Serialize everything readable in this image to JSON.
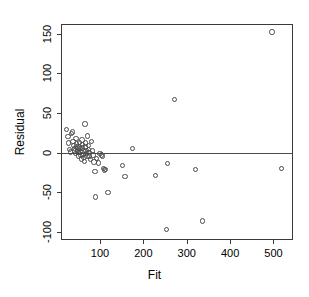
{
  "chart_data": {
    "type": "scatter",
    "title": "",
    "xlabel": "Fit",
    "ylabel": "Residual",
    "xlim": [
      10,
      545
    ],
    "ylim": [
      -110,
      162
    ],
    "xticks": [
      100,
      200,
      300,
      400,
      500
    ],
    "xtick_labels": [
      "100",
      "200",
      "300",
      "400",
      "500"
    ],
    "yticks": [
      -100,
      -50,
      0,
      50,
      100,
      150
    ],
    "ytick_labels": [
      "-100",
      "-50",
      "0",
      "50",
      "100",
      "150"
    ],
    "grid": false,
    "legend": null,
    "marker": "open-circle",
    "reference_lines": [
      {
        "orientation": "horizontal",
        "y": 0
      }
    ],
    "points": [
      {
        "x": 22,
        "y": 29
      },
      {
        "x": 26,
        "y": 20
      },
      {
        "x": 28,
        "y": 12
      },
      {
        "x": 30,
        "y": 4
      },
      {
        "x": 32,
        "y": 1
      },
      {
        "x": 34,
        "y": 24
      },
      {
        "x": 36,
        "y": 26
      },
      {
        "x": 38,
        "y": 14
      },
      {
        "x": 40,
        "y": 9
      },
      {
        "x": 41,
        "y": 5
      },
      {
        "x": 42,
        "y": 2
      },
      {
        "x": 43,
        "y": -1
      },
      {
        "x": 45,
        "y": 18
      },
      {
        "x": 46,
        "y": 11
      },
      {
        "x": 47,
        "y": 7
      },
      {
        "x": 48,
        "y": 3
      },
      {
        "x": 49,
        "y": 0
      },
      {
        "x": 50,
        "y": -4
      },
      {
        "x": 52,
        "y": 13
      },
      {
        "x": 53,
        "y": 8
      },
      {
        "x": 54,
        "y": 5
      },
      {
        "x": 55,
        "y": 1
      },
      {
        "x": 56,
        "y": -3
      },
      {
        "x": 57,
        "y": -8
      },
      {
        "x": 58,
        "y": 16
      },
      {
        "x": 59,
        "y": 10
      },
      {
        "x": 60,
        "y": 6
      },
      {
        "x": 61,
        "y": 2
      },
      {
        "x": 62,
        "y": -2
      },
      {
        "x": 63,
        "y": -6
      },
      {
        "x": 64,
        "y": -11
      },
      {
        "x": 65,
        "y": 36
      },
      {
        "x": 66,
        "y": 12
      },
      {
        "x": 67,
        "y": 7
      },
      {
        "x": 68,
        "y": 3
      },
      {
        "x": 69,
        "y": -1
      },
      {
        "x": 70,
        "y": -5
      },
      {
        "x": 71,
        "y": 21
      },
      {
        "x": 73,
        "y": 9
      },
      {
        "x": 74,
        "y": 4
      },
      {
        "x": 75,
        "y": 0
      },
      {
        "x": 76,
        "y": -4
      },
      {
        "x": 78,
        "y": -9
      },
      {
        "x": 80,
        "y": 14
      },
      {
        "x": 82,
        "y": 2
      },
      {
        "x": 84,
        "y": -3
      },
      {
        "x": 86,
        "y": -12
      },
      {
        "x": 88,
        "y": -24
      },
      {
        "x": 90,
        "y": -56
      },
      {
        "x": 92,
        "y": -7
      },
      {
        "x": 96,
        "y": -13
      },
      {
        "x": 100,
        "y": -1
      },
      {
        "x": 104,
        "y": -3
      },
      {
        "x": 106,
        "y": -4
      },
      {
        "x": 108,
        "y": -20
      },
      {
        "x": 110,
        "y": -22
      },
      {
        "x": 112,
        "y": -21
      },
      {
        "x": 118,
        "y": -50
      },
      {
        "x": 152,
        "y": -16
      },
      {
        "x": 158,
        "y": -30
      },
      {
        "x": 175,
        "y": 5
      },
      {
        "x": 228,
        "y": -29
      },
      {
        "x": 253,
        "y": -97
      },
      {
        "x": 255,
        "y": -14
      },
      {
        "x": 272,
        "y": 67
      },
      {
        "x": 320,
        "y": -21
      },
      {
        "x": 336,
        "y": -86
      },
      {
        "x": 497,
        "y": 152
      },
      {
        "x": 518,
        "y": -20
      }
    ]
  }
}
